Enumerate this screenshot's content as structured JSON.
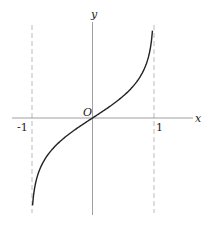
{
  "chart_data": {
    "type": "line",
    "title": "",
    "function_shape": "inverse hyperbolic tangent (artanh x), odd function through origin with vertical asymptotes at x = -1 and x = 1",
    "xlabel": "x",
    "ylabel": "y",
    "origin_label": "O",
    "x_tick_labels": [
      "-1",
      "1"
    ],
    "x_ticks": [
      -1,
      1
    ],
    "asymptotes": [
      {
        "type": "vertical",
        "x": -1,
        "style": "dashed"
      },
      {
        "type": "vertical",
        "x": 1,
        "style": "dashed"
      }
    ],
    "xlim": [
      -1.3,
      1.6
    ],
    "ylim": [
      -2.2,
      2.2
    ],
    "grid": false,
    "series": [
      {
        "name": "y = artanh x",
        "x": [
          -0.975,
          -0.9,
          -0.75,
          -0.5,
          -0.25,
          0,
          0.25,
          0.5,
          0.75,
          0.9,
          0.975
        ],
        "y": [
          -2.18,
          -1.47,
          -0.97,
          -0.55,
          -0.26,
          0,
          0.26,
          0.55,
          0.97,
          1.47,
          2.18
        ]
      }
    ],
    "colors": {
      "curve": "#222222",
      "axes": "#999999",
      "asymptote": "#aaaaaa"
    }
  },
  "labels": {
    "x_axis": "x",
    "y_axis": "y",
    "origin": "O",
    "tick_neg_one": "-1",
    "tick_one": "1"
  }
}
